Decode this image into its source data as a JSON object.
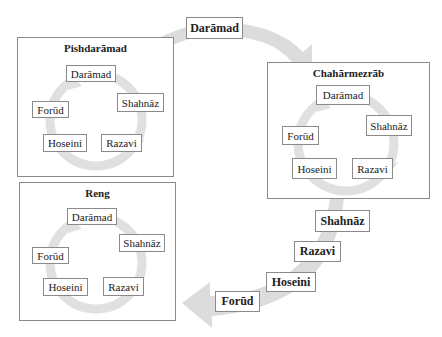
{
  "groups": [
    {
      "title": "Pishdarāmad",
      "nodes": [
        "Darāmad",
        "Shahnāz",
        "Razavi",
        "Hoseini",
        "Forūd"
      ]
    },
    {
      "title": "Chahārmezrāb",
      "nodes": [
        "Darāmad",
        "Shahnāz",
        "Razavi",
        "Hoseini",
        "Forūd"
      ]
    },
    {
      "title": "Reng",
      "nodes": [
        "Darāmad",
        "Shahnāz",
        "Razavi",
        "Hoseini",
        "Forūd"
      ]
    }
  ],
  "outer_flow": {
    "top_label": "Darāmad",
    "descending_labels": [
      "Shahnāz",
      "Razavi",
      "Hoseini",
      "Forūd"
    ]
  },
  "colors": {
    "arrow": "#d9d9d9",
    "border": "#8a8a8a",
    "text": "#222222"
  }
}
